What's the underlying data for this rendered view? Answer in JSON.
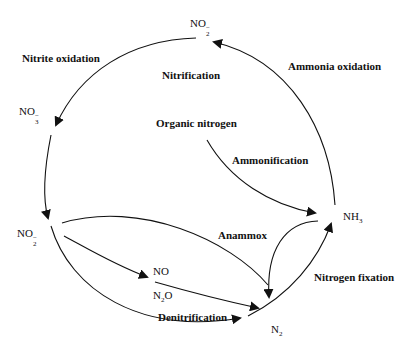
{
  "nodes": {
    "no2_top": {
      "base": "NO",
      "sub": "2",
      "sup": "−"
    },
    "no3": {
      "base": "NO",
      "sub": "3",
      "sup": "−"
    },
    "no2_left": {
      "base": "NO",
      "sub": "2",
      "sup": "−"
    },
    "no": {
      "text": "NO"
    },
    "n2o": {
      "base": "N",
      "sub": "2",
      "rest": "O"
    },
    "n2": {
      "base": "N",
      "sub": "2"
    },
    "nh3": {
      "base": "NH",
      "sub": "3"
    },
    "organic_nitrogen": {
      "text": "Organic nitrogen"
    }
  },
  "processes": {
    "nitrite_oxidation": "Nitrite oxidation",
    "nitrification": "Nitrification",
    "ammonia_oxidation": "Ammonia oxidation",
    "ammonification": "Ammonification",
    "anammox": "Anammox",
    "nitrogen_fixation": "Nitrogen fixation",
    "denitrification": "Denitrification"
  },
  "colors": {
    "line": "#111111",
    "background": "#ffffff"
  }
}
